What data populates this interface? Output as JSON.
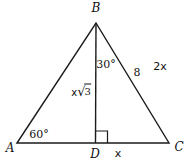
{
  "figure": {
    "type": "geometry-diagram",
    "colors": {
      "line": "#1b1b1b",
      "background": "#ffffff",
      "text": "#111111"
    },
    "vertices": {
      "B": "B",
      "A": "A",
      "C": "C",
      "D": "D"
    },
    "angles": {
      "at_A": "60°",
      "at_B": "30°"
    },
    "labels": {
      "side_BC_length": "8",
      "side_BC_expression": "2x",
      "segment_DC": "x",
      "altitude_BD_full": "x√3",
      "altitude_coefficient": "x",
      "altitude_radical": "√",
      "altitude_radicand": "3"
    }
  }
}
